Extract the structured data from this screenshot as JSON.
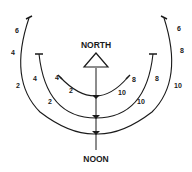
{
  "labels": {
    "north": "NORTH",
    "noon": "NOON"
  },
  "arcs": [
    {
      "name": "inner",
      "left_ticks": [
        "4",
        "2"
      ],
      "right_ticks": [
        "8",
        "10"
      ]
    },
    {
      "name": "middle",
      "left_ticks": [
        "4",
        "2"
      ],
      "right_ticks": [
        "8",
        "10"
      ]
    },
    {
      "name": "outer",
      "left_ticks": [
        "6",
        "4",
        "2"
      ],
      "right_ticks": [
        "6",
        "8",
        "10"
      ]
    }
  ],
  "colors": {
    "line": "#1a1a1a",
    "background": "#ffffff"
  }
}
